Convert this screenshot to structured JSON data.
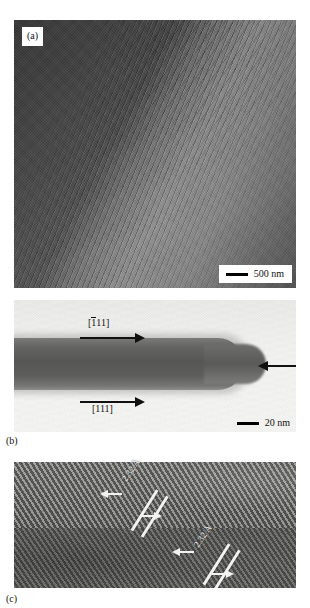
{
  "figure": {
    "type": "electron-microscopy-figure",
    "panel_count": 3
  },
  "panel_a": {
    "letter": "(a)",
    "scale_bar": {
      "length_label": "500 nm"
    },
    "description": "SEM image showing a dendritic/fibrous growth front across a diagonal boundary"
  },
  "panel_b": {
    "letter": "(b)",
    "scale_bar": {
      "length_label": "20 nm"
    },
    "direction_top": {
      "overbar_part": "1",
      "rest_part": "11",
      "bracket_open": "[",
      "bracket_close": "]"
    },
    "direction_bottom": {
      "text": "[111]"
    },
    "tip_arrow": "left-pointing-arrow",
    "description": "TEM bright-field image of a rod-shaped nanowire with a rounded tip"
  },
  "panel_c": {
    "letter": "(c)",
    "measurements": [
      {
        "value": "2.32 Å"
      },
      {
        "value": "2.32 Å"
      }
    ],
    "description": "HRTEM lattice-fringe image with two d-spacing measurements"
  }
}
